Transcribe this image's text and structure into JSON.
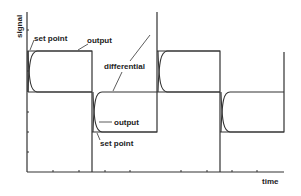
{
  "diagram": {
    "axis": {
      "x_label": "time",
      "y_label": "signal"
    },
    "labels": {
      "set_point_top": "set point",
      "output_top": "output",
      "differential": "differential",
      "output_bottom": "output",
      "set_point_bottom": "set point"
    },
    "colors": {
      "line": "#333333",
      "background": "#ffffff"
    }
  }
}
